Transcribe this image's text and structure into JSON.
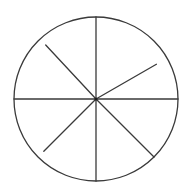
{
  "diagram": {
    "type": "divided-circle",
    "stroke_color": "#3a3a3a",
    "background_color": "#ffffff",
    "spoke_count": 8,
    "spokes": [
      {
        "name": "spoke-up",
        "angle_deg": 90,
        "reach_fraction": 1.0
      },
      {
        "name": "spoke-upper-right",
        "angle_deg": 30,
        "reach_fraction": 0.85
      },
      {
        "name": "spoke-right",
        "angle_deg": 0,
        "reach_fraction": 1.0
      },
      {
        "name": "spoke-lower-right",
        "angle_deg": -45,
        "reach_fraction": 1.0
      },
      {
        "name": "spoke-down",
        "angle_deg": -90,
        "reach_fraction": 1.0
      },
      {
        "name": "spoke-lower-left",
        "angle_deg": -135,
        "reach_fraction": 0.9
      },
      {
        "name": "spoke-left",
        "angle_deg": 180,
        "reach_fraction": 1.0
      },
      {
        "name": "spoke-upper-left",
        "angle_deg": 133,
        "reach_fraction": 0.9
      }
    ]
  }
}
